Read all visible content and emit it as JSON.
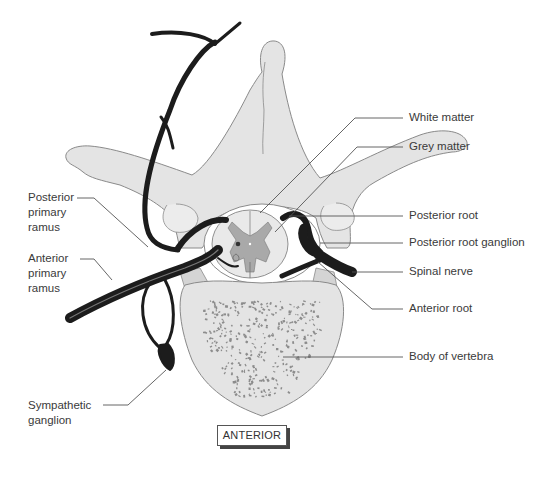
{
  "diagram": {
    "orientation_label": "ANTERIOR",
    "colors": {
      "bone_fill": "#e4e4e4",
      "bone_outline": "#8a8a8a",
      "nerve": "#1c1c1c",
      "grey_matter": "#a9a9a9",
      "white_matter": "#e9e9e9",
      "speckle": "#8c8c8c",
      "leader_line": "#555555"
    },
    "labels_left": [
      {
        "id": "posterior-primary-ramus",
        "lines": [
          "Posterior",
          "primary",
          "ramus"
        ]
      },
      {
        "id": "anterior-primary-ramus",
        "lines": [
          "Anterior",
          "primary",
          "ramus"
        ]
      },
      {
        "id": "sympathetic-ganglion",
        "lines": [
          "Sympathetic",
          "ganglion"
        ]
      }
    ],
    "labels_right": [
      {
        "id": "white-matter",
        "text": "White matter"
      },
      {
        "id": "grey-matter",
        "text": "Grey matter"
      },
      {
        "id": "posterior-root",
        "text": "Posterior root"
      },
      {
        "id": "posterior-root-ganglion",
        "text": "Posterior root ganglion"
      },
      {
        "id": "spinal-nerve",
        "text": "Spinal nerve"
      },
      {
        "id": "anterior-root",
        "text": "Anterior root"
      },
      {
        "id": "body-of-vertebra",
        "text": "Body of vertebra"
      }
    ]
  }
}
